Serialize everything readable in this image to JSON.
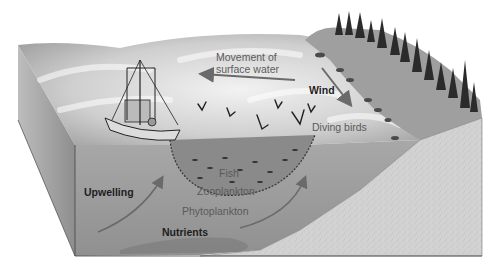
{
  "diagram": {
    "labels": {
      "movement_line1": "Movement of",
      "movement_line2": "surface water",
      "wind": "Wind",
      "diving_birds": "Diving birds",
      "fish": "Fish",
      "zooplankton": "Zooplankton",
      "phytoplankton": "Phytoplankton",
      "upwelling": "Upwelling",
      "nutrients": "Nutrients"
    },
    "elements": [
      "fishing-boat",
      "fishing-net",
      "diving-birds",
      "coastal-cliff",
      "conifer-forest",
      "sandy-seafloor-slope",
      "upwelling-arrows",
      "wind-arrow",
      "surface-current-arrow"
    ],
    "colors": {
      "water": "#9a9a9a",
      "surface": "#d8d8d8",
      "seafloor": "#cfcfcf",
      "arrow": "#6a6a6a",
      "trees": "#2a2a2a"
    }
  }
}
